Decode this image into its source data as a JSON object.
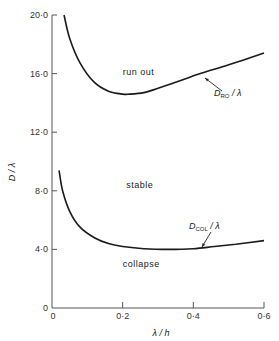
{
  "chart_data": {
    "type": "line",
    "title": "",
    "xlabel": "λ / h",
    "ylabel": "D / λ",
    "xlim": [
      0,
      0.6
    ],
    "ylim": [
      0,
      20.0
    ],
    "x_ticks": [
      "0",
      "0·2",
      "0·4",
      "0·6"
    ],
    "y_ticks": [
      "0",
      "4·0",
      "8·0",
      "12·0",
      "16·0",
      "20·0"
    ],
    "grid": false,
    "series": [
      {
        "name": "D_RO / λ",
        "label_main": "D",
        "label_sub": "RO",
        "label_tail": " / λ",
        "x": [
          0.034,
          0.05,
          0.08,
          0.12,
          0.16,
          0.2,
          0.22,
          0.26,
          0.3,
          0.36,
          0.42,
          0.5,
          0.6
        ],
        "values": [
          20.0,
          18.4,
          16.7,
          15.4,
          14.8,
          14.6,
          14.6,
          14.7,
          15.0,
          15.5,
          16.0,
          16.6,
          17.4
        ]
      },
      {
        "name": "D_COL / λ",
        "label_main": "D",
        "label_sub": "COL",
        "label_tail": " / λ",
        "x": [
          0.02,
          0.03,
          0.05,
          0.08,
          0.12,
          0.16,
          0.2,
          0.26,
          0.33,
          0.4,
          0.46,
          0.52,
          0.6
        ],
        "values": [
          9.4,
          8.0,
          6.6,
          5.5,
          4.8,
          4.4,
          4.2,
          4.05,
          4.0,
          4.05,
          4.2,
          4.35,
          4.6
        ]
      }
    ],
    "annotations": [
      {
        "text": "run out",
        "x": 0.2,
        "y": 15.9
      },
      {
        "text": "stable",
        "x": 0.21,
        "y": 8.2
      },
      {
        "text": "collapse",
        "x": 0.2,
        "y": 2.8
      }
    ]
  }
}
